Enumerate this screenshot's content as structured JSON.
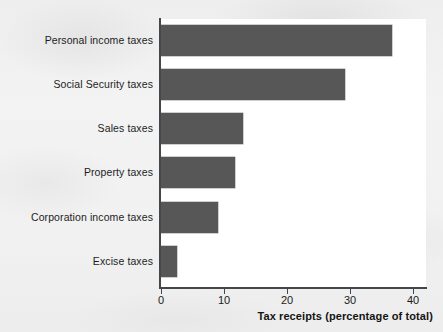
{
  "chart_data": {
    "type": "bar",
    "orientation": "horizontal",
    "title": "",
    "xlabel": "Tax receipts (percentage of total)",
    "ylabel": "",
    "categories": [
      "Personal income taxes",
      "Social Security taxes",
      "Sales taxes",
      "Property taxes",
      "Corporation income taxes",
      "Excise taxes"
    ],
    "values": [
      36.7,
      29.2,
      13.0,
      11.7,
      9.0,
      2.5
    ],
    "xlim": [
      0,
      42
    ],
    "xticks": [
      0,
      10,
      20,
      30,
      40
    ],
    "xtick_labels": [
      "0",
      "10",
      "20",
      "30",
      "40"
    ],
    "grid": false,
    "legend": null,
    "bar_color": "#575757",
    "axis_color": "#43464a",
    "plot_background": "#ffffff",
    "page_background": "#f1f1f1"
  }
}
